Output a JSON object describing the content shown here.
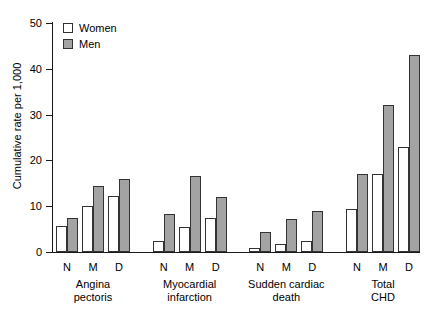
{
  "chart_data": {
    "type": "bar",
    "title": "",
    "subtitle": "",
    "xlabel": "",
    "ylabel": "Cumulative rate per 1,000",
    "ylim": [
      0,
      50
    ],
    "yticks": [
      0,
      10,
      20,
      30,
      40,
      50
    ],
    "ytick_labels": [
      "0",
      "10",
      "20",
      "30",
      "40",
      "50"
    ],
    "grid": false,
    "legend_position": "top-left",
    "legend": [
      "Women",
      "Men"
    ],
    "colors": {
      "women": "#ffffff",
      "men": "#a3a3a3",
      "outline": "#333333",
      "axis": "#1a1a1a",
      "text": "#000000"
    },
    "categories": [
      "N",
      "M",
      "D"
    ],
    "groups": [
      {
        "name": "Angina pectoris",
        "label_lines": "Angina\npectoris",
        "categories": [
          "N",
          "M",
          "D"
        ],
        "series": [
          {
            "name": "Women",
            "values": [
              5.7,
              10.0,
              12.2
            ]
          },
          {
            "name": "Men",
            "values": [
              7.5,
              14.5,
              16.0
            ]
          }
        ]
      },
      {
        "name": "Myocardial infarction",
        "label_lines": "Myocardial\ninfarction",
        "categories": [
          "N",
          "M",
          "D"
        ],
        "series": [
          {
            "name": "Women",
            "values": [
              2.3,
              5.5,
              7.5
            ]
          },
          {
            "name": "Men",
            "values": [
              8.3,
              16.5,
              12.0
            ]
          }
        ]
      },
      {
        "name": "Sudden cardiac death",
        "label_lines": "Sudden cardiac\ndeath",
        "categories": [
          "N",
          "M",
          "D"
        ],
        "series": [
          {
            "name": "Women",
            "values": [
              0.8,
              1.8,
              2.5
            ]
          },
          {
            "name": "Men",
            "values": [
              4.3,
              7.3,
              9.0
            ]
          }
        ]
      },
      {
        "name": "Total CHD",
        "label_lines": "Total\nCHD",
        "categories": [
          "N",
          "M",
          "D"
        ],
        "series": [
          {
            "name": "Women",
            "values": [
              9.5,
              17.0,
              23.0
            ]
          },
          {
            "name": "Men",
            "values": [
              17.0,
              32.0,
              43.0
            ]
          }
        ]
      }
    ]
  }
}
